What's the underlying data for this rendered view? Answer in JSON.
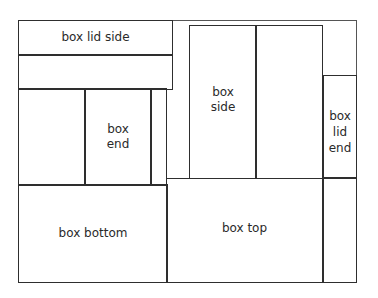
{
  "diagram": {
    "pieces": [
      {
        "id": "box-lid-side",
        "label": "box lid side"
      },
      {
        "id": "box-end",
        "label": "box\nend"
      },
      {
        "id": "box-side",
        "label": "box\nside"
      },
      {
        "id": "box-lid-end",
        "label": "box\nlid\nend"
      },
      {
        "id": "box-bottom",
        "label": "box bottom"
      },
      {
        "id": "box-top",
        "label": "box top"
      }
    ],
    "labels": {
      "box_lid_side": "box lid side",
      "box_end_1": "box",
      "box_end_2": "end",
      "box_side_1": "box",
      "box_side_2": "side",
      "box_lid_end_1": "box",
      "box_lid_end_2": "lid",
      "box_lid_end_3": "end",
      "box_bottom": "box bottom",
      "box_top": "box top"
    },
    "line_color": "#2e2e2e"
  }
}
